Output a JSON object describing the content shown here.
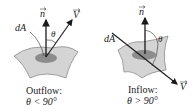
{
  "panels": [
    {
      "id": "outflow",
      "normal_label": "n",
      "velocity_label": "V",
      "area_label": "dA",
      "angle_label": "θ",
      "caption_line1": "Outflow:",
      "caption_line2": "θ < 90°"
    },
    {
      "id": "inflow",
      "normal_label": "n",
      "velocity_label": "V",
      "area_label": "dA",
      "angle_label": "θ",
      "caption_line1": "Inflow:",
      "caption_line2": "θ > 90°"
    }
  ],
  "colors": {
    "surface_fill": "#d4d4d4",
    "surface_stroke": "#8a8a8a",
    "patch_fill": "#8c8c8c",
    "line": "#1a1a1a"
  }
}
